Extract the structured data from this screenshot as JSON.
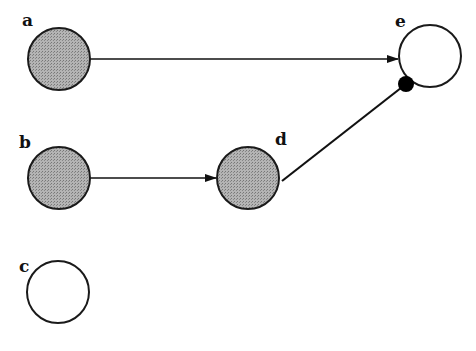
{
  "diagram": {
    "nodes": [
      {
        "id": "a",
        "label": "a",
        "cx": 59,
        "cy": 59,
        "r": 31,
        "filled": true
      },
      {
        "id": "b",
        "label": "b",
        "cx": 59,
        "cy": 178,
        "r": 31,
        "filled": true
      },
      {
        "id": "c",
        "label": "c",
        "cx": 58,
        "cy": 292,
        "r": 31,
        "filled": false
      },
      {
        "id": "d",
        "label": "d",
        "cx": 248,
        "cy": 178,
        "r": 31,
        "filled": true
      },
      {
        "id": "e",
        "label": "e",
        "cx": 430,
        "cy": 56,
        "r": 31,
        "filled": false
      }
    ],
    "edges": [
      {
        "from": "a",
        "to": "e",
        "type": "arrow"
      },
      {
        "from": "b",
        "to": "d",
        "type": "arrow"
      },
      {
        "from": "d",
        "to": "e",
        "type": "dot-terminated"
      }
    ],
    "colors": {
      "fill": "#a8a8a8",
      "stroke": "#1a1a1a"
    }
  }
}
